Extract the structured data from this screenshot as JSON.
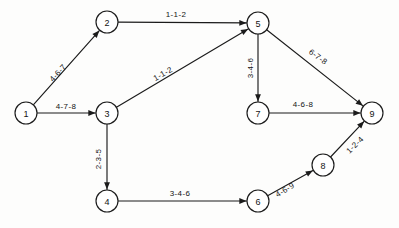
{
  "diagram": {
    "type": "activity-network",
    "background_color": "#fdfdfc",
    "line_color": "#1b1b1b",
    "node_radius": 11,
    "nodes": [
      {
        "id": "1",
        "label": "1",
        "x": 26,
        "y": 113
      },
      {
        "id": "2",
        "label": "2",
        "x": 107,
        "y": 22
      },
      {
        "id": "3",
        "label": "3",
        "x": 107,
        "y": 113
      },
      {
        "id": "4",
        "label": "4",
        "x": 107,
        "y": 201
      },
      {
        "id": "5",
        "label": "5",
        "x": 258,
        "y": 23
      },
      {
        "id": "6",
        "label": "6",
        "x": 258,
        "y": 201
      },
      {
        "id": "7",
        "label": "7",
        "x": 258,
        "y": 113
      },
      {
        "id": "8",
        "label": "8",
        "x": 323,
        "y": 165
      },
      {
        "id": "9",
        "label": "9",
        "x": 372,
        "y": 113
      }
    ],
    "edges": [
      {
        "id": "e-1-2",
        "from": "1",
        "to": "2",
        "label": "4-6-7",
        "label_x": 58,
        "label_y": 73,
        "rotate": -48
      },
      {
        "id": "e-1-3",
        "from": "1",
        "to": "3",
        "label": "4-7-8",
        "label_x": 66,
        "label_y": 106,
        "rotate": 0
      },
      {
        "id": "e-2-5",
        "from": "2",
        "to": "5",
        "label": "1-1-2",
        "label_x": 176,
        "label_y": 14,
        "rotate": 0
      },
      {
        "id": "e-3-5",
        "from": "3",
        "to": "5",
        "label": "1-1-2",
        "label_x": 163,
        "label_y": 74,
        "rotate": -29
      },
      {
        "id": "e-3-4",
        "from": "3",
        "to": "4",
        "label": "2-3-5",
        "label_x": 98,
        "label_y": 159,
        "rotate": -90
      },
      {
        "id": "e-5-7",
        "from": "5",
        "to": "7",
        "label": "3-4-6",
        "label_x": 250,
        "label_y": 68,
        "rotate": -90
      },
      {
        "id": "e-5-9",
        "from": "5",
        "to": "9",
        "label": "6-7-8",
        "label_x": 318,
        "label_y": 57,
        "rotate": 36
      },
      {
        "id": "e-7-9",
        "from": "7",
        "to": "9",
        "label": "4-6-8",
        "label_x": 303,
        "label_y": 104,
        "rotate": 0
      },
      {
        "id": "e-4-6",
        "from": "4",
        "to": "6",
        "label": "3-4-6",
        "label_x": 180,
        "label_y": 193,
        "rotate": 0
      },
      {
        "id": "e-6-8",
        "from": "6",
        "to": "8",
        "label": "4-6-9",
        "label_x": 285,
        "label_y": 190,
        "rotate": -31
      },
      {
        "id": "e-8-9",
        "from": "8",
        "to": "9",
        "label": "1-2-4",
        "label_x": 355,
        "label_y": 145,
        "rotate": -44
      }
    ]
  }
}
